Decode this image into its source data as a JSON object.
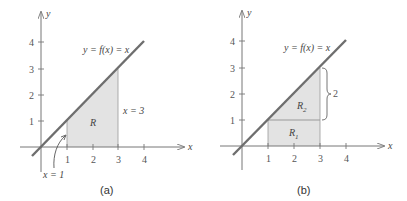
{
  "panels": [
    {
      "id": "a",
      "caption": "(a)",
      "axis_labels": {
        "x": "x",
        "y": "y"
      },
      "x_ticks": [
        "1",
        "2",
        "3",
        "4"
      ],
      "y_ticks": [
        "1",
        "2",
        "3",
        "4"
      ],
      "curve_label": "y = f(x) = x",
      "region_label": "R",
      "right_bound_label": "x = 3",
      "left_bound_label": "x = 1"
    },
    {
      "id": "b",
      "caption": "(b)",
      "axis_labels": {
        "x": "x",
        "y": "y"
      },
      "x_ticks": [
        "1",
        "2",
        "3",
        "4"
      ],
      "y_ticks": [
        "1",
        "2",
        "3",
        "4"
      ],
      "curve_label": "y = f(x) = x",
      "region_labels": [
        "R",
        "R"
      ],
      "region_subscripts": [
        "1",
        "2"
      ],
      "brace_label": "2"
    }
  ],
  "colors": {
    "line": "#6e6e6e",
    "fill": "#e3e3e3",
    "axis": "#777777"
  }
}
